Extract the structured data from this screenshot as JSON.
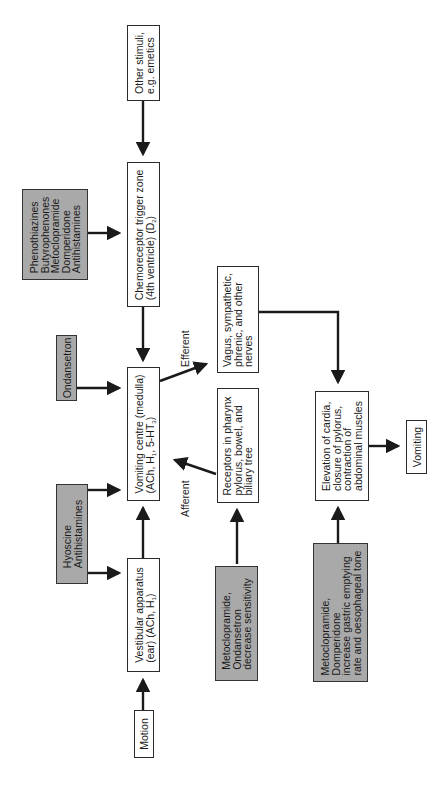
{
  "diagram": {
    "orientation": "rotated -90deg (reads bottom-to-top)",
    "nodes": {
      "other_stimuli": {
        "lines": [
          "Other stimuli,",
          "e.g. emetics"
        ],
        "type": "process"
      },
      "ctz": {
        "lines": [
          "Chemoreceptor trigger zone",
          "(4th ventricle) (D",
          "2",
          ")"
        ],
        "line1": "Chemoreceptor trigger zone",
        "line2_pre": "(4th ventricle) (D",
        "line2_sub": "2",
        "line2_post": ")",
        "type": "process"
      },
      "vomiting_centre": {
        "line1": "Vomiting centre (medulla)",
        "line2_a": "(ACh, H",
        "line2_sub1": "1",
        "line2_b": ", 5-HT",
        "line2_sub2": "3",
        "line2_c": ")",
        "type": "process"
      },
      "vestibular": {
        "line1": "Vestibular apparatus",
        "line2_a": "(ear) (ACh, H",
        "line2_sub": "1",
        "line2_b": ")",
        "type": "process"
      },
      "motion": {
        "lines": [
          "Motion"
        ],
        "type": "process"
      },
      "vagus": {
        "lines": [
          "Vagus, sympathetic,",
          "phrenic, and other",
          "nerves"
        ],
        "type": "process"
      },
      "receptors": {
        "lines": [
          "Receptors in pharynx",
          "pylorus, bowel, and",
          "biliary tree"
        ],
        "type": "process"
      },
      "elevation": {
        "lines": [
          "Elevation of cardia,",
          "closure of pylorus,",
          "contraction of",
          "abdominal muscles"
        ],
        "type": "process"
      },
      "vomiting": {
        "lines": [
          "Vomiting"
        ],
        "type": "process"
      },
      "drug_ctz": {
        "lines": [
          "Phenothiazines",
          "Butyrophenones",
          "Metoclopramide",
          "Domperidone",
          "Antihistamines"
        ],
        "type": "drug"
      },
      "drug_ondansetron": {
        "lines": [
          "Ondansetron"
        ],
        "type": "drug"
      },
      "drug_hyoscine": {
        "lines": [
          "Hyoscine",
          "Antihistamines"
        ],
        "type": "drug"
      },
      "drug_receptors": {
        "lines": [
          "Metoclopramide,",
          "Ondansetron",
          "decrease sensitivity"
        ],
        "type": "drug"
      },
      "drug_gastric": {
        "lines": [
          "Metoclopramide,",
          "Domperidone",
          "increase gastric emptying",
          "rate and oesophageal tone"
        ],
        "type": "drug"
      }
    },
    "edge_labels": {
      "efferent": "Efferent",
      "afferent": "Afferent"
    },
    "colors": {
      "drug_fill": "#a9a9a9",
      "box_fill": "#ffffff",
      "stroke": "#1a1a1a",
      "background": "#ffffff"
    }
  }
}
